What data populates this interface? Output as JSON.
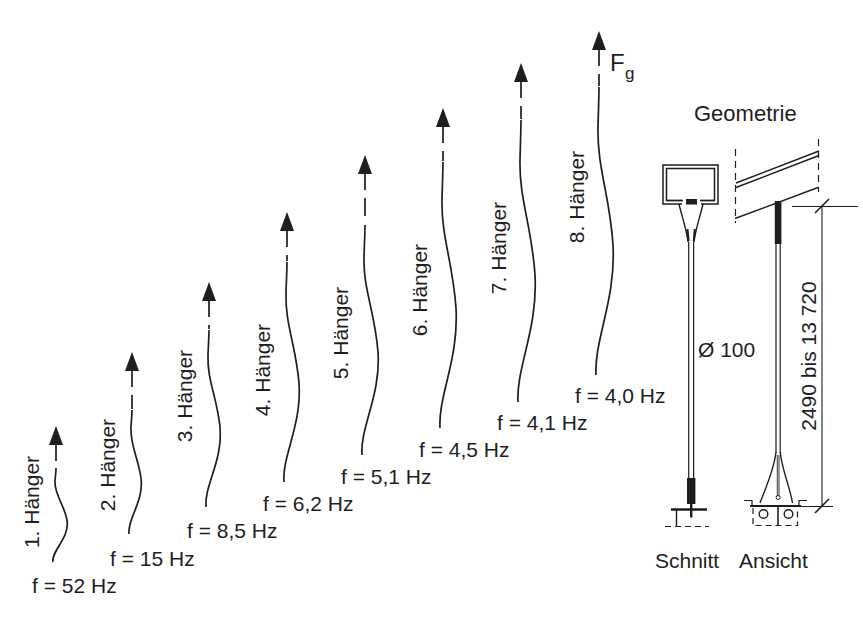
{
  "figure": {
    "force": {
      "symbol": "F",
      "subscript": "g"
    },
    "hangers": [
      {
        "label": "1. Hänger",
        "frequency_label": "f = 52 Hz",
        "frequency_hz": 52.0
      },
      {
        "label": "2. Hänger",
        "frequency_label": "f = 15 Hz",
        "frequency_hz": 15.0
      },
      {
        "label": "3. Hänger",
        "frequency_label": "f = 8,5 Hz",
        "frequency_hz": 8.5
      },
      {
        "label": "4. Hänger",
        "frequency_label": "f = 6,2 Hz",
        "frequency_hz": 6.2
      },
      {
        "label": "5. Hänger",
        "frequency_label": "f = 5,1 Hz",
        "frequency_hz": 5.1
      },
      {
        "label": "6. Hänger",
        "frequency_label": "f = 4,5 Hz",
        "frequency_hz": 4.5
      },
      {
        "label": "7. Hänger",
        "frequency_label": "f = 4,1 Hz",
        "frequency_hz": 4.1
      },
      {
        "label": "8. Hänger",
        "frequency_label": "f = 4,0 Hz",
        "frequency_hz": 4.0
      }
    ],
    "geometry": {
      "title": "Geometrie",
      "diameter_label": "Ø 100",
      "length_dimension": "2490 bis 13 720",
      "section_view_label": "Schnitt",
      "elevation_view_label": "Ansicht"
    },
    "colors": {
      "ink": "#1e1e1e",
      "background": "#ffffff"
    }
  }
}
